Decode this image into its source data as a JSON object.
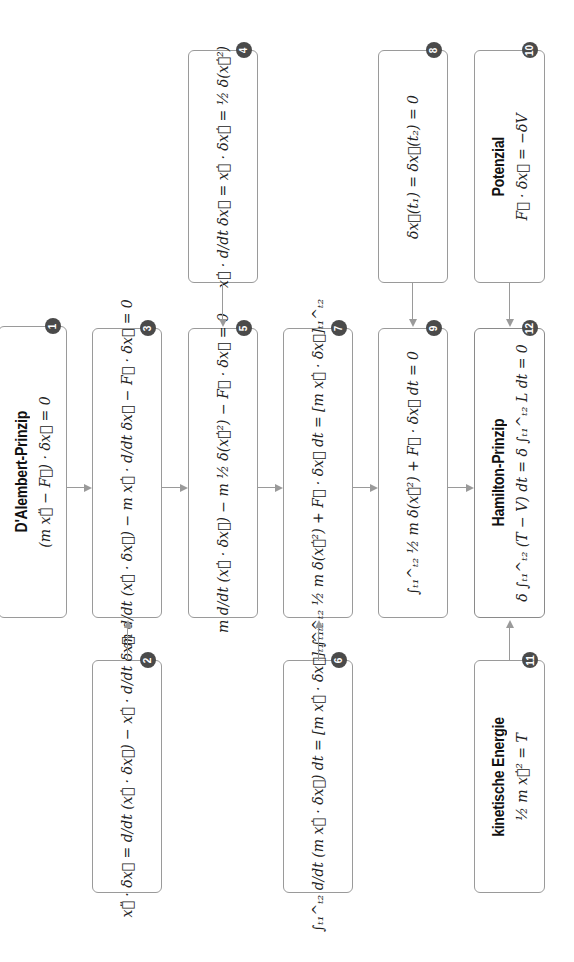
{
  "diagram": {
    "orientation": "rotated 90° counter-clockwise",
    "colors": {
      "border": "#9a9a9a",
      "badge": "#4a4a4a",
      "arrow": "#9a9a9a",
      "text": "#1a1a1a"
    },
    "nodes": [
      {
        "id": 1,
        "title": "D'Alembert-Prinzip",
        "formula": "(m x⃗̈ − F⃗) · δx⃗ = 0"
      },
      {
        "id": 2,
        "title": "",
        "formula": "x⃗̈ · δx⃗ = d/dt (x⃗̇ · δx⃗) − x⃗̇ · d/dt δx⃗"
      },
      {
        "id": 3,
        "title": "",
        "formula": "m d/dt (x⃗̇ · δx⃗) − m x⃗̇ · d/dt δx⃗ − F⃗ · δx⃗ = 0"
      },
      {
        "id": 4,
        "title": "",
        "formula": "x⃗̇ · d/dt δx⃗ = x⃗̇ · δx⃗̇ = ½ δ(x⃗̇²)"
      },
      {
        "id": 5,
        "title": "",
        "formula": "m d/dt (x⃗̇ · δx⃗) − m ½ δ(x⃗̇²) − F⃗ · δx⃗ = 0"
      },
      {
        "id": 6,
        "title": "",
        "formula": "∫ₜ₁^ₜ₂ d/dt (m x⃗̇ · δx⃗) dt = [m x⃗̇ · δx⃗]ₜ₁^ₜ₂"
      },
      {
        "id": 7,
        "title": "",
        "formula": "∫ₜ₁^ₜ₂ ½ m δ(x⃗̇²) + F⃗ · δx⃗ dt = [m x⃗̇ · δx⃗]ₜ₁^ₜ₂"
      },
      {
        "id": 8,
        "title": "",
        "formula": "δx⃗(t₁) = δx⃗(t₂) = 0"
      },
      {
        "id": 9,
        "title": "",
        "formula": "∫ₜ₁^ₜ₂ ½ m δ(x⃗̇²) + F⃗ · δx⃗ dt = 0"
      },
      {
        "id": 10,
        "title": "Potenzial",
        "formula": "F⃗ · δx⃗ = −δV"
      },
      {
        "id": 11,
        "title": "kinetische Energie",
        "formula": "½ m x⃗̇² = T"
      },
      {
        "id": 12,
        "title": "Hamilton-Prinzip",
        "formula": "δ ∫ₜ₁^ₜ₂ (T − V) dt = δ ∫ₜ₁^ₜ₂ L dt = 0"
      }
    ],
    "badges": [
      "1",
      "2",
      "3",
      "4",
      "5",
      "6",
      "7",
      "8",
      "9",
      "10",
      "11",
      "12"
    ],
    "edges": [
      {
        "from": 1,
        "to": 3
      },
      {
        "from": 2,
        "to": 3
      },
      {
        "from": 3,
        "to": 5
      },
      {
        "from": 4,
        "to": 5
      },
      {
        "from": 5,
        "to": 7
      },
      {
        "from": 6,
        "to": 7
      },
      {
        "from": 7,
        "to": 9
      },
      {
        "from": 8,
        "to": 9
      },
      {
        "from": 9,
        "to": 12
      },
      {
        "from": 10,
        "to": 12
      },
      {
        "from": 11,
        "to": 12
      }
    ]
  }
}
